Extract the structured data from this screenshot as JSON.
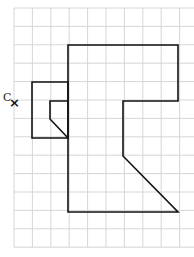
{
  "diagram": {
    "grid": {
      "x0": 14,
      "y0": 8,
      "cell": 18.4,
      "cols": 10,
      "rows": 13,
      "color": "#d6d6d6"
    },
    "shape_stroke": "#111111",
    "shapes": [
      {
        "name": "large-shape",
        "points": "68,45 178,45 178,101 123,101 123,156 178,212 68,212"
      },
      {
        "name": "small-shape",
        "points": "32,82 68,82 68,138 32,138"
      },
      {
        "name": "inner-shape",
        "points": "68,101 50,101 50,119 68,138"
      }
    ],
    "center_label": "C",
    "center_mark": "×"
  }
}
